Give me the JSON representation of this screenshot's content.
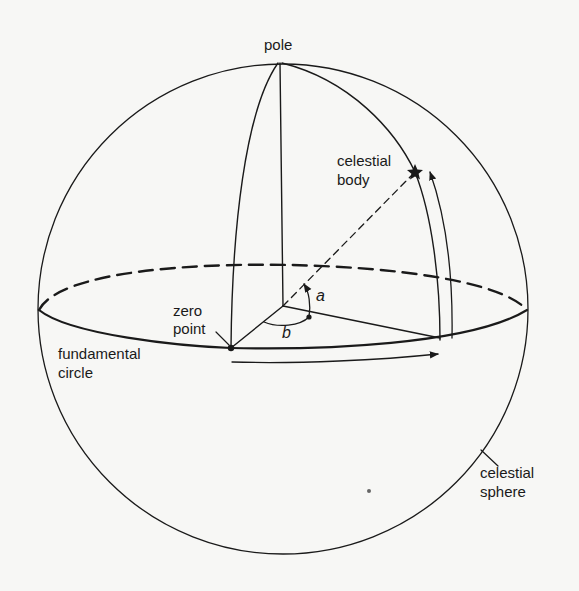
{
  "diagram": {
    "type": "celestial coordinate system",
    "labels": {
      "pole": "pole",
      "celestial_body_line1": "celestial",
      "celestial_body_line2": "body",
      "zero_point_line1": "zero",
      "zero_point_line2": "point",
      "fundamental_circle_line1": "fundamental",
      "fundamental_circle_line2": "circle",
      "celestial_sphere_line1": "celestial",
      "celestial_sphere_line2": "sphere",
      "angle_a": "a",
      "angle_b": "b"
    },
    "colors": {
      "background": "#f7f7f5",
      "ink": "#1a1a1a"
    }
  }
}
